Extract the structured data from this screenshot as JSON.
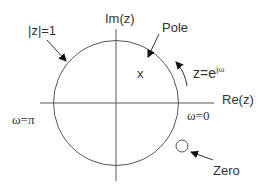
{
  "diagram": {
    "type": "unit-circle-z-plane",
    "labels": {
      "unit_circle": "|z|=1",
      "imag_axis": "Im(z)",
      "real_axis": "Re(z)",
      "pole": "Pole",
      "pole_marker": "x",
      "rotation_base": "z=e",
      "rotation_exp": "jω",
      "omega_pi": "ω=π",
      "omega_zero": "ω=0",
      "zero": "Zero"
    },
    "colors": {
      "line": "#555555",
      "text": "#333333",
      "arrow": "#111111",
      "background": "#ffffff"
    }
  }
}
